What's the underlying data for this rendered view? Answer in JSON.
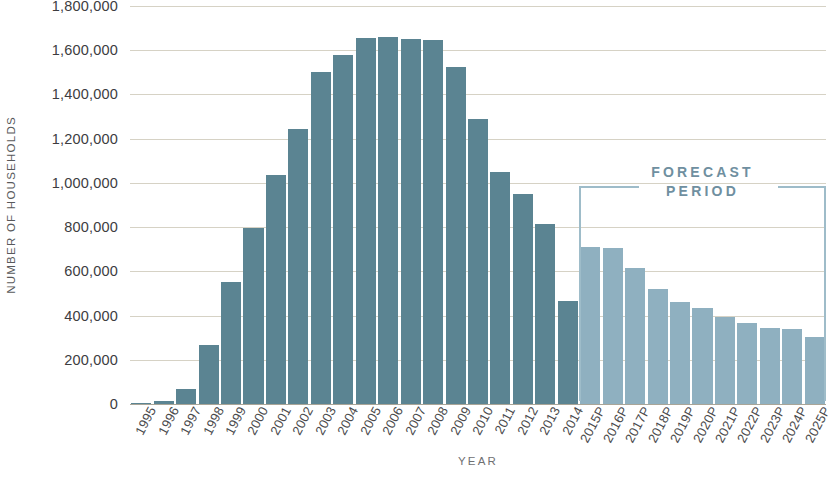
{
  "chart_data": {
    "type": "bar",
    "title": "",
    "xlabel": "YEAR",
    "ylabel": "NUMBER OF HOUSEHOLDS",
    "ylim": [
      0,
      1800000
    ],
    "ytick_step": 200000,
    "grid": true,
    "legend_position": "none",
    "categories": [
      "1995",
      "1996",
      "1997",
      "1998",
      "1999",
      "2000",
      "2001",
      "2002",
      "2003",
      "2004",
      "2005",
      "2006",
      "2007",
      "2008",
      "2009",
      "2010",
      "2011",
      "2012",
      "2013",
      "2014",
      "2015P",
      "2016P",
      "2017P",
      "2018P",
      "2019P",
      "2020P",
      "2021P",
      "2022P",
      "2023P",
      "2024P",
      "2025P"
    ],
    "values": [
      5000,
      12000,
      70000,
      265000,
      550000,
      795000,
      1035000,
      1245000,
      1500000,
      1580000,
      1655000,
      1660000,
      1650000,
      1645000,
      1525000,
      1290000,
      1050000,
      950000,
      815000,
      465000,
      710000,
      705000,
      615000,
      520000,
      460000,
      435000,
      395000,
      365000,
      345000,
      340000,
      305000
    ],
    "series_segments": [
      {
        "name": "Historical",
        "start_index": 0,
        "end_index": 19,
        "color": "#5b8492"
      },
      {
        "name": "Forecast",
        "start_index": 20,
        "end_index": 30,
        "color": "#8fb0c0"
      }
    ],
    "ytick_labels": [
      "1,800,000",
      "1,600,000",
      "1,400,000",
      "1,200,000",
      "1,000,000",
      "800,000",
      "600,000",
      "400,000",
      "200,000",
      "0"
    ],
    "ytick_values": [
      1800000,
      1600000,
      1400000,
      1200000,
      1000000,
      800000,
      600000,
      400000,
      200000,
      0
    ],
    "annotations": [
      {
        "name": "forecast-period",
        "line1": "FORECAST",
        "line2": "PERIOD",
        "start_category": "2015P",
        "end_category": "2025P",
        "color": "#6f8fa0",
        "bracket_color": "#9ebcc9"
      }
    ]
  },
  "colors": {
    "historical_bar": "#5b8492",
    "forecast_bar": "#8fb0c0",
    "gridline": "#cfcabb",
    "baseline": "#a9a598",
    "axis_text": "#4a4a4c",
    "axis_title": "#6f7072",
    "forecast_text": "#6f8fa0",
    "background": "#ffffff"
  }
}
